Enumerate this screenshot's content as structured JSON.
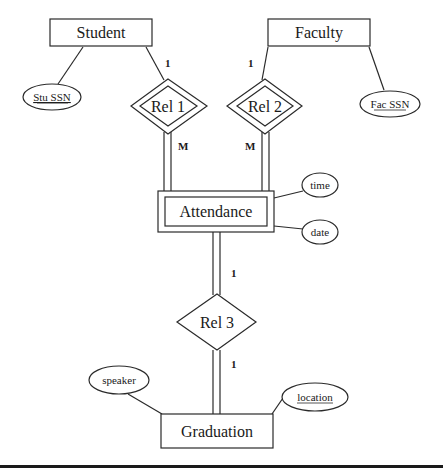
{
  "diagram": {
    "type": "ER diagram",
    "entities": [
      {
        "id": "student",
        "label": "Student",
        "weak": false
      },
      {
        "id": "faculty",
        "label": "Faculty",
        "weak": false
      },
      {
        "id": "attendance",
        "label": "Attendance",
        "weak": true
      },
      {
        "id": "graduation",
        "label": "Graduation",
        "weak": false
      }
    ],
    "relationships": [
      {
        "id": "rel1",
        "label": "Rel 1",
        "identifying": true
      },
      {
        "id": "rel2",
        "label": "Rel 2",
        "identifying": true
      },
      {
        "id": "rel3",
        "label": "Rel 3",
        "identifying": false
      }
    ],
    "attributes": [
      {
        "id": "stu_ssn",
        "label": "Stu SSN",
        "key": true,
        "owner": "student"
      },
      {
        "id": "fac_ssn",
        "label": "Fac SSN",
        "key": true,
        "owner": "faculty"
      },
      {
        "id": "time",
        "label": "time",
        "key": false,
        "owner": "attendance"
      },
      {
        "id": "date",
        "label": "date",
        "key": false,
        "owner": "attendance"
      },
      {
        "id": "speaker",
        "label": "speaker",
        "key": false,
        "owner": "graduation"
      },
      {
        "id": "location",
        "label": "location",
        "key": true,
        "owner": "graduation"
      }
    ],
    "cardinalities": {
      "student_rel1": "1",
      "rel1_attendance": "M",
      "faculty_rel2": "1",
      "rel2_attendance": "M",
      "attendance_rel3": "1",
      "rel3_graduation": "1"
    }
  }
}
